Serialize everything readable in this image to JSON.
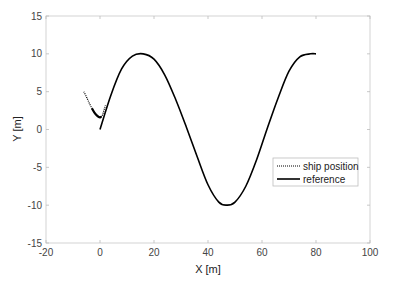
{
  "chart_data": {
    "type": "line",
    "title": "",
    "xlabel": "X [m]",
    "ylabel": "Y [m]",
    "xlim": [
      -20,
      100
    ],
    "ylim": [
      -15,
      15
    ],
    "xticks": [
      -20,
      0,
      20,
      40,
      60,
      80,
      100
    ],
    "yticks": [
      -15,
      -10,
      -5,
      0,
      5,
      10,
      15
    ],
    "grid": false,
    "legend_position": "right-middle",
    "series": [
      {
        "name": "ship position",
        "style": "dotted",
        "x": [
          -6,
          -5,
          -4,
          -3,
          -2,
          -1,
          0,
          0.5,
          1,
          2
        ],
        "y": [
          5,
          4.3,
          3.5,
          2.8,
          2.2,
          1.8,
          1.6,
          1.7,
          2.0,
          3.2
        ]
      },
      {
        "name": "reference",
        "style": "solid",
        "x": [
          0,
          4,
          8,
          12,
          16,
          20,
          24,
          28,
          32,
          36,
          40,
          44,
          47,
          50,
          54,
          58,
          62,
          66,
          70,
          74,
          78,
          80
        ],
        "y": [
          0,
          4.5,
          8.0,
          9.7,
          10,
          9.3,
          7.2,
          4.0,
          0.3,
          -3.6,
          -7.3,
          -9.6,
          -10,
          -9.6,
          -7.5,
          -4.0,
          0.2,
          4.2,
          7.7,
          9.6,
          10,
          10
        ]
      }
    ]
  }
}
